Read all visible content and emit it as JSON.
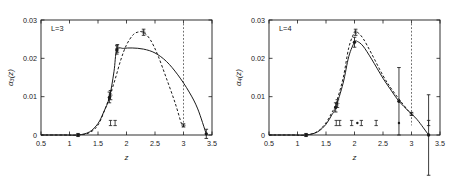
{
  "figure": {
    "title": "",
    "panel_count": 2
  },
  "chart_data": [
    {
      "type": "line",
      "title": "L=3",
      "panel_label": "L=3",
      "xlabel": "z",
      "ylabel": "α₃(z)",
      "xlim": [
        0.5,
        3.5
      ],
      "ylim": [
        0.0,
        0.03
      ],
      "xticks": [
        0.5,
        1,
        1.5,
        2,
        2.5,
        3,
        3.5
      ],
      "xticklabels": [
        "0.5",
        "1",
        "1.5",
        "2",
        "2.5",
        "3",
        "3.5"
      ],
      "yticks": [
        0,
        0.01,
        0.02,
        0.03
      ],
      "yticklabels": [
        "0",
        "0.01",
        "0.02",
        "0.03"
      ],
      "grid": false,
      "legend": "none",
      "series": [
        {
          "name": "solid-curve",
          "style": "solid",
          "x": [
            0.5,
            0.9,
            1.15,
            1.35,
            1.5,
            1.6,
            1.7,
            1.78,
            1.83,
            1.95,
            2.1,
            2.3,
            2.5,
            2.7,
            2.9,
            3.1,
            3.25,
            3.4
          ],
          "y": [
            0.0,
            0.0,
            0.0,
            0.0008,
            0.003,
            0.006,
            0.0098,
            0.0165,
            0.0222,
            0.0226,
            0.0227,
            0.0224,
            0.0214,
            0.0192,
            0.0157,
            0.0112,
            0.0068,
            0.0002
          ]
        },
        {
          "name": "dashed-curve",
          "style": "dashed",
          "x": [
            0.5,
            0.9,
            1.15,
            1.35,
            1.5,
            1.62,
            1.7,
            1.8,
            1.9,
            2.0,
            2.12,
            2.22,
            2.3,
            2.42,
            2.55,
            2.7,
            2.85,
            2.97,
            3.0
          ],
          "y": [
            0.0,
            0.0,
            0.0,
            0.0006,
            0.0026,
            0.0066,
            0.0099,
            0.0145,
            0.0196,
            0.0235,
            0.0262,
            0.0269,
            0.0268,
            0.0248,
            0.0208,
            0.0148,
            0.0085,
            0.0027,
            0.0024
          ]
        }
      ],
      "points": [
        {
          "x": 1.15,
          "y": 0.0,
          "yerr": 0.0004,
          "marker": "circle"
        },
        {
          "x": 1.7,
          "y": 0.0098,
          "yerr": 0.0014,
          "marker": "circle"
        },
        {
          "x": 1.72,
          "y": 0.0104,
          "yerr": 0.0012,
          "marker": "star"
        },
        {
          "x": 1.83,
          "y": 0.0222,
          "yerr": 0.0011,
          "marker": "circle"
        },
        {
          "x": 1.84,
          "y": 0.0226,
          "yerr": 0.001,
          "marker": "star"
        },
        {
          "x": 2.3,
          "y": 0.0268,
          "yerr": 0.0008,
          "marker": "star"
        },
        {
          "x": 3.0,
          "y": 0.0025,
          "yerr": 0.0004,
          "marker": "star"
        },
        {
          "x": 3.4,
          "y": 0.0003,
          "yerr": 0.0012,
          "marker": "circle"
        }
      ],
      "below_axis_markers": [
        {
          "x": 1.72,
          "type": "errorbar-cap"
        },
        {
          "x": 1.8,
          "type": "errorbar-cap"
        }
      ],
      "vertical_dotted_line_x": 3.0,
      "annotations": []
    },
    {
      "type": "line",
      "title": "L=4",
      "panel_label": "L=4",
      "xlabel": "z",
      "ylabel": "α₄(z)",
      "xlim": [
        0.5,
        3.5
      ],
      "ylim": [
        0.0,
        0.03
      ],
      "xticks": [
        0.5,
        1,
        1.5,
        2,
        2.5,
        3,
        3.5
      ],
      "xticklabels": [
        "0.5",
        "1",
        "1.5",
        "2",
        "2.5",
        "3",
        "3.5"
      ],
      "yticks": [
        0,
        0.01,
        0.02,
        0.03
      ],
      "yticklabels": [
        "0",
        "0.01",
        "0.02",
        "0.03"
      ],
      "grid": false,
      "legend": "none",
      "series": [
        {
          "name": "solid-curve",
          "style": "solid",
          "x": [
            0.5,
            0.9,
            1.15,
            1.35,
            1.5,
            1.6,
            1.67,
            1.8,
            1.9,
            2.0,
            2.05,
            2.15,
            2.3,
            2.5,
            2.65,
            2.78,
            2.95,
            3.1,
            3.3
          ],
          "y": [
            0.0,
            0.0,
            0.0,
            0.0008,
            0.0028,
            0.0052,
            0.0072,
            0.0135,
            0.0205,
            0.0242,
            0.0244,
            0.0232,
            0.0198,
            0.0148,
            0.0115,
            0.0088,
            0.0062,
            0.004,
            0.0
          ]
        },
        {
          "name": "dashed-curve",
          "style": "dashed",
          "x": [
            0.5,
            0.9,
            1.15,
            1.35,
            1.5,
            1.6,
            1.67,
            1.8,
            1.9,
            2.0,
            2.05,
            2.15,
            2.3,
            2.5,
            2.65,
            2.8,
            2.95,
            3.0
          ],
          "y": [
            0.0,
            0.0,
            0.0,
            0.0009,
            0.0032,
            0.0058,
            0.008,
            0.0148,
            0.0228,
            0.0268,
            0.0268,
            0.0252,
            0.0212,
            0.0155,
            0.012,
            0.009,
            0.0062,
            0.0055
          ]
        }
      ],
      "points": [
        {
          "x": 1.15,
          "y": 0.0,
          "yerr": 0.0004,
          "marker": "circle"
        },
        {
          "x": 1.67,
          "y": 0.0072,
          "yerr": 0.0012,
          "marker": "circle"
        },
        {
          "x": 1.7,
          "y": 0.0082,
          "yerr": 0.001,
          "marker": "star"
        },
        {
          "x": 2.0,
          "y": 0.0242,
          "yerr": 0.0013,
          "marker": "circle"
        },
        {
          "x": 2.02,
          "y": 0.0268,
          "yerr": 0.0008,
          "marker": "star"
        },
        {
          "x": 2.78,
          "y": 0.0088,
          "yerr": 0.0088,
          "marker": "circle"
        },
        {
          "x": 3.0,
          "y": 0.0055,
          "yerr": 0.0004,
          "marker": "star"
        },
        {
          "x": 3.3,
          "y": 0.0,
          "yerr": 0.0105,
          "marker": "circle"
        }
      ],
      "below_axis_markers": [
        {
          "x": 1.68,
          "type": "errorbar-cap"
        },
        {
          "x": 1.74,
          "type": "errorbar-cap"
        },
        {
          "x": 1.95,
          "type": "errorbar-cap"
        },
        {
          "x": 2.05,
          "type": "dot"
        },
        {
          "x": 2.12,
          "type": "errorbar-cap"
        },
        {
          "x": 2.38,
          "type": "errorbar-cap"
        },
        {
          "x": 2.78,
          "type": "dot"
        },
        {
          "x": 3.3,
          "type": "errorbar-cap"
        }
      ],
      "vertical_dotted_line_x": 3.0,
      "annotations": []
    }
  ]
}
